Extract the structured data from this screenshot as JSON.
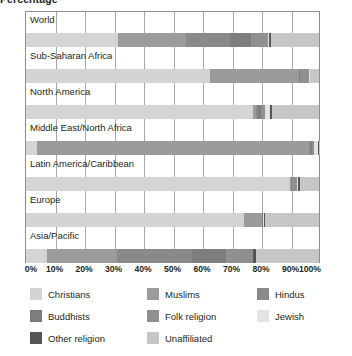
{
  "chart_data": {
    "type": "bar",
    "orientation": "horizontal-stacked",
    "title": "Percentage",
    "xlabel": "",
    "ylabel": "",
    "xlim": [
      0,
      100
    ],
    "grid": true,
    "legend_position": "bottom",
    "tick_labels": [
      "0%",
      "10%",
      "20%",
      "30%",
      "40%",
      "50%",
      "60%",
      "70%",
      "80%",
      "90%",
      "100%"
    ],
    "tick_values": [
      0,
      10,
      20,
      30,
      40,
      50,
      60,
      70,
      80,
      90,
      100
    ],
    "categories": [
      "World",
      "Sub-Saharan Africa",
      "North America",
      "Middle East/North Africa",
      "Latin America/Caribbean",
      "Europe",
      "Asia/Pacific"
    ],
    "series": [
      {
        "name": "Christians",
        "color": "#d4d4d4",
        "values": [
          31.5,
          62.9,
          77.4,
          3.7,
          90.0,
          74.5,
          7.1
        ]
      },
      {
        "name": "Muslims",
        "color": "#9b9b9b",
        "values": [
          23.2,
          30.2,
          1.0,
          93.0,
          0.4,
          5.9,
          24.1
        ]
      },
      {
        "name": "Hindus",
        "color": "#8a8a8a",
        "values": [
          15.0,
          0.2,
          0.7,
          0.6,
          0.3,
          0.2,
          25.3
        ]
      },
      {
        "name": "Buddhists",
        "color": "#7d7d7d",
        "values": [
          7.1,
          0.1,
          1.1,
          0.3,
          0.1,
          0.2,
          11.9
        ]
      },
      {
        "name": "Folk religion",
        "color": "#909090",
        "values": [
          5.9,
          3.3,
          1.4,
          0.6,
          1.7,
          0.2,
          9.0
        ]
      },
      {
        "name": "Jewish",
        "color": "#e4e4e4",
        "values": [
          0.2,
          0.1,
          1.8,
          1.6,
          0.2,
          0.2,
          0.1
        ]
      },
      {
        "name": "Other religion",
        "color": "#555555",
        "values": [
          0.8,
          0.2,
          0.6,
          0.1,
          0.7,
          0.4,
          0.9
        ]
      },
      {
        "name": "Unaffiliated",
        "color": "#c6c6c6",
        "values": [
          16.3,
          3.0,
          16.0,
          0.1,
          6.6,
          18.4,
          21.6
        ]
      }
    ]
  },
  "legend": {
    "rows": [
      [
        {
          "label": "Christians",
          "color": "#d4d4d4",
          "swatch": "legend-swatch-christians"
        },
        {
          "label": "Muslims",
          "color": "#9b9b9b",
          "swatch": "legend-swatch-muslims"
        },
        {
          "label": "Hindus",
          "color": "#8a8a8a",
          "swatch": "legend-swatch-hindus"
        }
      ],
      [
        {
          "label": "Buddhists",
          "color": "#7d7d7d",
          "swatch": "legend-swatch-buddhists"
        },
        {
          "label": "Folk religion",
          "color": "#909090",
          "swatch": "legend-swatch-folk-religion"
        },
        {
          "label": "Jewish",
          "color": "#e4e4e4",
          "swatch": "legend-swatch-jewish"
        }
      ],
      [
        {
          "label": "Other religion",
          "color": "#555555",
          "swatch": "legend-swatch-other-religion"
        },
        {
          "label": "Unaffiliated",
          "color": "#c6c6c6",
          "swatch": "legend-swatch-unaffiliated"
        }
      ]
    ]
  },
  "colors": {
    "axis_line": "#8d8d8d",
    "gridline": "#a8a8a8",
    "text": "#231f20",
    "background": "#ffffff"
  }
}
